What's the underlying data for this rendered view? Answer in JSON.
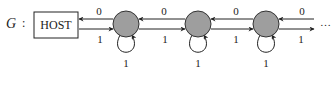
{
  "diagram": {
    "graph_label": "G",
    "separator": ":",
    "host_label": "HOST",
    "node_color": "#9e9e9e",
    "nodes": [
      {
        "id": "n1",
        "self_loop_label": "1"
      },
      {
        "id": "n2",
        "self_loop_label": "1"
      },
      {
        "id": "n3",
        "self_loop_label": "1"
      }
    ],
    "edges": [
      {
        "from": "n1",
        "to": "host",
        "label": "0"
      },
      {
        "from": "host",
        "to": "n1",
        "label": "1"
      },
      {
        "from": "n2",
        "to": "n1",
        "label": "0"
      },
      {
        "from": "n1",
        "to": "n2",
        "label": "1"
      },
      {
        "from": "n3",
        "to": "n2",
        "label": "0"
      },
      {
        "from": "n2",
        "to": "n3",
        "label": "1"
      },
      {
        "from": "next",
        "to": "n3",
        "label": "0"
      },
      {
        "from": "n3",
        "to": "next",
        "label": "1"
      }
    ],
    "continuation": "…"
  }
}
